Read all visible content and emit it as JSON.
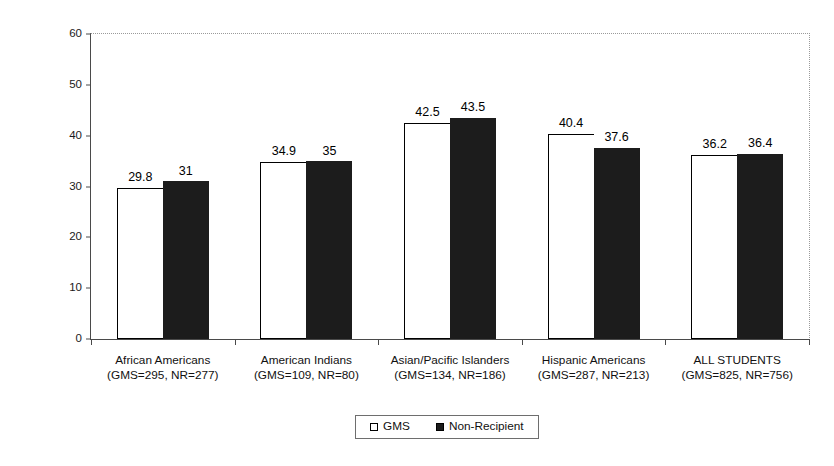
{
  "chart_data": {
    "type": "bar",
    "title": "",
    "subtitle": "",
    "xlabel": "",
    "ylabel": "",
    "ylim": [
      0,
      60
    ],
    "yticks": [
      0,
      10,
      20,
      30,
      40,
      50,
      60
    ],
    "grid": false,
    "legend_position": "bottom-center",
    "categories": [
      "African Americans",
      "American Indians",
      "Asian/Pacific Islanders",
      "Hispanic Americans",
      "ALL STUDENTS"
    ],
    "category_sublabels": [
      "(GMS=295, NR=277)",
      "(GMS=109, NR=80)",
      "(GMS=134, NR=186)",
      "(GMS=287, NR=213)",
      "(GMS=825, NR=756)"
    ],
    "series": [
      {
        "name": "GMS",
        "color": "#ffffff",
        "values": [
          29.8,
          34.9,
          42.5,
          40.4,
          36.2
        ],
        "value_labels": [
          "29.8",
          "34.9",
          "42.5",
          "40.4",
          "36.2"
        ]
      },
      {
        "name": "Non-Recipient",
        "color": "#1c1c1c",
        "values": [
          31,
          35,
          43.5,
          37.6,
          36.4
        ],
        "value_labels": [
          "31",
          "35",
          "43.5",
          "37.6",
          "36.4"
        ]
      }
    ],
    "ytick_labels": [
      "0",
      "10",
      "20",
      "30",
      "40",
      "50",
      "60"
    ]
  },
  "legend": {
    "entries": [
      {
        "label": "GMS",
        "swatch": "open-square"
      },
      {
        "label": "Non-Recipient",
        "swatch": "filled-square"
      }
    ]
  }
}
